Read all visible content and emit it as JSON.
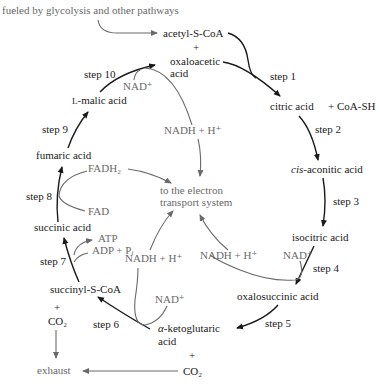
{
  "colors": {
    "main_text": "#1a1a1a",
    "aux_text": "#6a6a6a",
    "background": "#ffffff"
  },
  "header": {
    "source": "fueled by glycolysis and other pathways"
  },
  "compounds": {
    "acetyl_scoa": "acetyl-S-CoA",
    "plus1": "+",
    "oxaloacetic_1": "oxaloacetic",
    "oxaloacetic_2": "acid",
    "citric": "citric acid",
    "coash": "+ CoA-SH",
    "cis_italic": "cis",
    "cis_rest": "-aconitic acid",
    "isocitric": "isocitric acid",
    "oxalosuccinic": "oxalosuccinic acid",
    "aketo_alpha": "α",
    "aketo_rest": "-ketoglutaric",
    "aketo_acid": "acid",
    "plus2": "+",
    "co2_right": "CO₂",
    "succinyl": "succinyl-S-CoA",
    "plus3": "+",
    "co2_left": "CO₂",
    "succinic": "succinic acid",
    "fumaric": "fumaric acid",
    "malic_L": "L",
    "malic_rest": "-malic acid"
  },
  "steps": {
    "s1": "step 1",
    "s2": "step 2",
    "s3": "step 3",
    "s4": "step 4",
    "s5": "step 5",
    "s6": "step 6",
    "s7": "step 7",
    "s8": "step 8",
    "s9": "step 9",
    "s10": "step 10"
  },
  "cofactors": {
    "nad_step10": "NAD⁺",
    "nadh_step10": "NADH + H⁺",
    "fadh2": "FADH₂",
    "fad": "FAD",
    "atp": "ATP",
    "adp_pi": "ADP + Pᵢ",
    "nadh_step6": "NADH + H⁺",
    "nad_step6": "NAD⁺",
    "nadh_step4": "NADH + H⁺",
    "nad_step4": "NAD⁺"
  },
  "center": {
    "line1": "to the electron",
    "line2": "transport system"
  },
  "footer": {
    "exhaust": "exhaust"
  }
}
